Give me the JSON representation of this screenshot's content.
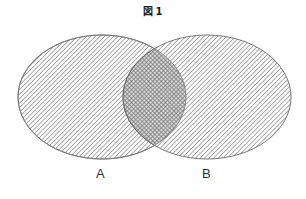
{
  "figure": {
    "title_prefix": "図",
    "title_number": "1"
  },
  "sets": [
    {
      "id": "A",
      "label": "A",
      "cx": 102,
      "cy": 97,
      "rx": 84,
      "ry": 62,
      "fill_pattern": "diagonal-hatch"
    },
    {
      "id": "B",
      "label": "B",
      "cx": 207,
      "cy": 97,
      "rx": 84,
      "ry": 62,
      "fill_pattern": "diagonal-hatch"
    }
  ],
  "intersection": {
    "sets": [
      "A",
      "B"
    ],
    "fill_pattern": "cross-hatch"
  },
  "colors": {
    "hatch": "#8a8a8a",
    "outline": "#777777",
    "crosshatch": "#6e6e6e",
    "background": "#ffffff"
  }
}
